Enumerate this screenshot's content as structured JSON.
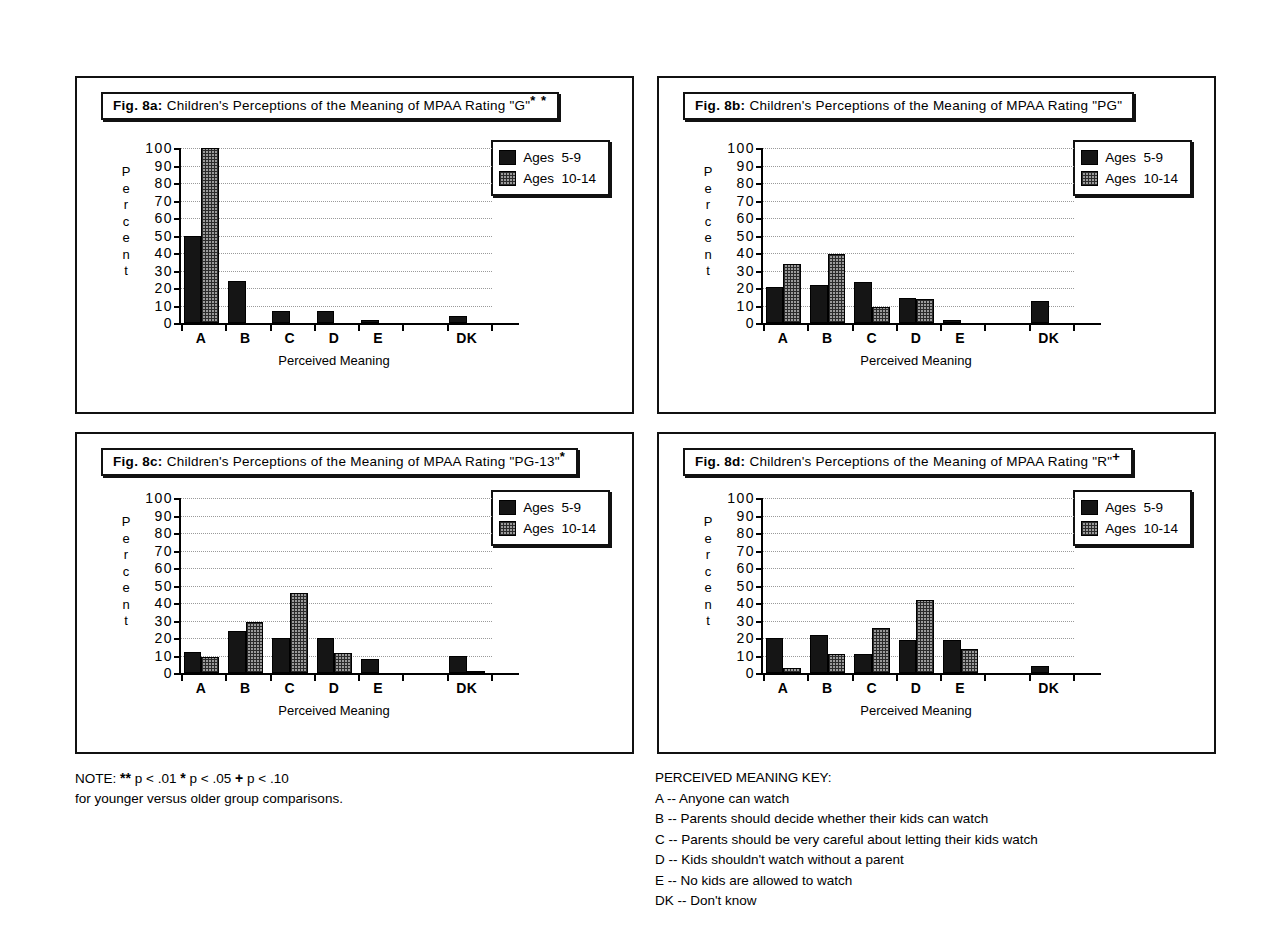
{
  "figure": {
    "axis_title": "Perceived Meaning",
    "y_axis_label_letters": [
      "P",
      "e",
      "r",
      "c",
      "e",
      "n",
      "t"
    ],
    "y_ticks": [
      100,
      90,
      80,
      70,
      60,
      50,
      40,
      30,
      20,
      10,
      0
    ],
    "categories": [
      "A",
      "B",
      "C",
      "D",
      "E",
      "",
      "DK"
    ],
    "legend": [
      {
        "key": "young",
        "label": "Ages  5-9",
        "color": "#151515"
      },
      {
        "key": "older",
        "label": "Ages  10-14",
        "color": "#9b9b9b"
      }
    ]
  },
  "panels": [
    {
      "id": "a",
      "fig_label": "Fig. 8a:",
      "title": "Children's Perceptions of the Meaning of MPAA Rating \"G\"",
      "significance": "* *"
    },
    {
      "id": "b",
      "fig_label": "Fig. 8b:",
      "title": "Children's Perceptions of the Meaning of MPAA Rating \"PG\"",
      "significance": ""
    },
    {
      "id": "c",
      "fig_label": "Fig. 8c:",
      "title": "Children's Perceptions of the Meaning of MPAA Rating \"PG-13\"",
      "significance": "*"
    },
    {
      "id": "d",
      "fig_label": "Fig. 8d:",
      "title": "Children's Perceptions of the Meaning of MPAA Rating \"R\"",
      "significance": "+"
    }
  ],
  "chart_data": [
    {
      "type": "bar",
      "title": "Fig. 8a:  Children's Perceptions of the Meaning of MPAA Rating \"G\"**",
      "xlabel": "Perceived Meaning",
      "ylabel": "Percent",
      "ylim": [
        0,
        100
      ],
      "yticks": [
        0,
        10,
        20,
        30,
        40,
        50,
        60,
        70,
        80,
        90,
        100
      ],
      "grid": true,
      "legend_position": "top-right",
      "categories": [
        "A",
        "B",
        "C",
        "D",
        "E",
        "",
        "DK"
      ],
      "series": [
        {
          "name": "Ages 5-9",
          "values": [
            50,
            24,
            7,
            7,
            1.5,
            0,
            4
          ]
        },
        {
          "name": "Ages 10-14",
          "values": [
            100,
            0,
            0,
            0,
            0,
            0,
            0
          ]
        }
      ]
    },
    {
      "type": "bar",
      "title": "Fig. 8b:  Children's Perceptions of the Meaning of MPAA Rating \"PG\"",
      "xlabel": "Perceived Meaning",
      "ylabel": "Percent",
      "ylim": [
        0,
        100
      ],
      "yticks": [
        0,
        10,
        20,
        30,
        40,
        50,
        60,
        70,
        80,
        90,
        100
      ],
      "grid": true,
      "legend_position": "top-right",
      "categories": [
        "A",
        "B",
        "C",
        "D",
        "E",
        "",
        "DK"
      ],
      "series": [
        {
          "name": "Ages 5-9",
          "values": [
            20.5,
            22,
            23.5,
            14.5,
            1.5,
            0,
            12.5
          ]
        },
        {
          "name": "Ages 10-14",
          "values": [
            34,
            39.5,
            9,
            13.5,
            0,
            0,
            0
          ]
        }
      ]
    },
    {
      "type": "bar",
      "title": "Fig. 8c:  Children's Perceptions of the Meaning of MPAA Rating \"PG-13\"*",
      "xlabel": "Perceived Meaning",
      "ylabel": "Percent",
      "ylim": [
        0,
        100
      ],
      "yticks": [
        0,
        10,
        20,
        30,
        40,
        50,
        60,
        70,
        80,
        90,
        100
      ],
      "grid": true,
      "legend_position": "top-right",
      "categories": [
        "A",
        "B",
        "C",
        "D",
        "E",
        "",
        "DK"
      ],
      "series": [
        {
          "name": "Ages 5-9",
          "values": [
            12,
            24,
            20,
            20,
            8,
            0,
            10
          ]
        },
        {
          "name": "Ages 10-14",
          "values": [
            9,
            29,
            46,
            11.5,
            0,
            0,
            1
          ]
        }
      ]
    },
    {
      "type": "bar",
      "title": "Fig. 8d:  Children's Perceptions of the Meaning of MPAA Rating \"R\"+",
      "xlabel": "Perceived Meaning",
      "ylabel": "Percent",
      "ylim": [
        0,
        100
      ],
      "yticks": [
        0,
        10,
        20,
        30,
        40,
        50,
        60,
        70,
        80,
        90,
        100
      ],
      "grid": true,
      "legend_position": "top-right",
      "categories": [
        "A",
        "B",
        "C",
        "D",
        "E",
        "",
        "DK"
      ],
      "series": [
        {
          "name": "Ages 5-9",
          "values": [
            20,
            22,
            11,
            19,
            19,
            0,
            4
          ]
        },
        {
          "name": "Ages 10-14",
          "values": [
            3,
            11,
            26,
            41.5,
            14,
            0,
            0
          ]
        }
      ]
    }
  ],
  "note": {
    "line1_prefix": "NOTE:  ",
    "line1_a": "** ",
    "line1_b": "p < .01     ",
    "line1_c": "* ",
    "line1_d": "p < .05     ",
    "line1_e": "+ ",
    "line1_f": "p < .10",
    "line2": "for younger versus older group comparisons."
  },
  "key": {
    "heading": "PERCEIVED MEANING KEY:",
    "entries": [
      "A -- Anyone can watch",
      "B -- Parents should decide whether their kids can watch",
      "C -- Parents should be very careful about letting their kids watch",
      "D -- Kids shouldn't watch without a parent",
      "E -- No kids are allowed to watch",
      "DK -- Don't know"
    ]
  }
}
